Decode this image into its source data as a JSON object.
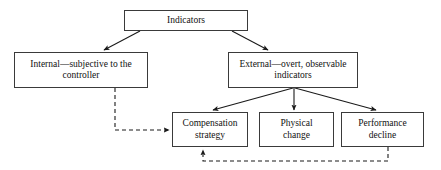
{
  "diagram": {
    "colors": {
      "background": "#ffffff",
      "box_border": "#3a3a3a",
      "box_fill": "#ffffff",
      "text": "#111111",
      "solid_edge": "#1a1a1a",
      "dashed_edge": "#1a1a1a"
    },
    "nodes": [
      {
        "id": "indicators",
        "label": "Indicators"
      },
      {
        "id": "internal",
        "label": "Internal—subjective to the\ncontroller"
      },
      {
        "id": "external",
        "label": "External—overt, observable\nindicators"
      },
      {
        "id": "compensation",
        "label": "Compensation\nstrategy"
      },
      {
        "id": "physical",
        "label": "Physical\nchange"
      },
      {
        "id": "performance",
        "label": "Performance\ndecline"
      }
    ],
    "edges": [
      {
        "id": "indicators-to-internal",
        "from": "indicators",
        "to": "internal",
        "style": "solid",
        "arrow": "end"
      },
      {
        "id": "indicators-to-external",
        "from": "indicators",
        "to": "external",
        "style": "solid",
        "arrow": "end"
      },
      {
        "id": "external-to-compensation",
        "from": "external",
        "to": "compensation",
        "style": "solid",
        "arrow": "end"
      },
      {
        "id": "external-to-physical",
        "from": "external",
        "to": "physical",
        "style": "solid",
        "arrow": "end"
      },
      {
        "id": "external-to-performance",
        "from": "external",
        "to": "performance",
        "style": "solid",
        "arrow": "end"
      },
      {
        "id": "internal-to-compensation",
        "from": "internal",
        "to": "compensation",
        "style": "dashed",
        "arrow": "end"
      },
      {
        "id": "performance-to-compensation",
        "from": "performance",
        "to": "compensation",
        "style": "dashed",
        "arrow": "end"
      }
    ]
  }
}
